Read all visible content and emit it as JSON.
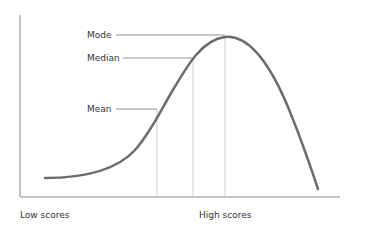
{
  "diagram": {
    "type": "negatively-skewed distribution",
    "labels": {
      "mode": "Mode",
      "median": "Median",
      "mean": "Mean"
    },
    "x_axis": {
      "low_label": "Low scores",
      "high_label": "High scores"
    },
    "colors": {
      "curve": "#6b6b6b",
      "axis": "#8a8a8a",
      "leader": "#7a7a7a",
      "guide": "#cfcfcf",
      "text": "#333333"
    }
  }
}
